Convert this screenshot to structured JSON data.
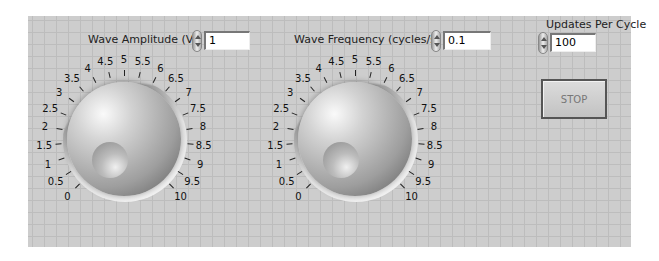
{
  "controls": {
    "amplitude": {
      "label": "Wave Amplitude (V)",
      "value": "1"
    },
    "frequency": {
      "label": "Wave Frequency (cycles/s)",
      "value": "0.1"
    },
    "updates": {
      "label": "Updates Per Cycle",
      "value": "100"
    },
    "stop": {
      "label": "STOP"
    }
  },
  "knob_scale": [
    "0",
    "0.5",
    "1",
    "1.5",
    "2",
    "2.5",
    "3",
    "3.5",
    "4",
    "4.5",
    "5",
    "5.5",
    "6",
    "6.5",
    "7",
    "7.5",
    "8",
    "8.5",
    "9",
    "9.5",
    "10"
  ],
  "colors": {
    "panel": "#cdcdcd",
    "grid": "#bdbdbd"
  }
}
